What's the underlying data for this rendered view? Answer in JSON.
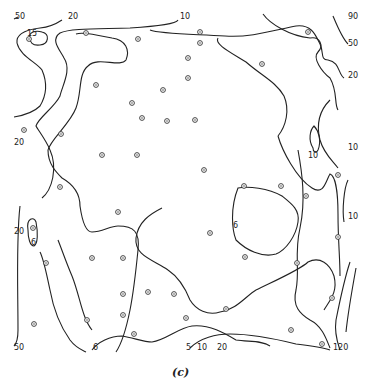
{
  "figure": {
    "caption": "(c)",
    "contour_labels": [
      {
        "text": "50",
        "x": 15,
        "y": 19
      },
      {
        "text": "20",
        "x": 68,
        "y": 19
      },
      {
        "text": "10",
        "x": 180,
        "y": 19
      },
      {
        "text": "90",
        "x": 348,
        "y": 19
      },
      {
        "text": "50",
        "x": 348,
        "y": 46
      },
      {
        "text": "20",
        "x": 348,
        "y": 78
      },
      {
        "text": "10",
        "x": 348,
        "y": 150
      },
      {
        "text": "20",
        "x": 14,
        "y": 145
      },
      {
        "text": "10",
        "x": 308,
        "y": 158
      },
      {
        "text": "10",
        "x": 348,
        "y": 219
      },
      {
        "text": "20",
        "x": 14,
        "y": 234
      },
      {
        "text": "6",
        "x": 31,
        "y": 245
      },
      {
        "text": "6",
        "x": 233,
        "y": 228
      },
      {
        "text": "50",
        "x": 14,
        "y": 350
      },
      {
        "text": "6",
        "x": 93,
        "y": 350
      },
      {
        "text": "5",
        "x": 186,
        "y": 350
      },
      {
        "text": "10",
        "x": 197,
        "y": 350
      },
      {
        "text": "20",
        "x": 217,
        "y": 350
      },
      {
        "text": "120",
        "x": 333,
        "y": 350
      },
      {
        "text": "15",
        "x": 27,
        "y": 36
      }
    ],
    "sample_points": [
      [
        29,
        39
      ],
      [
        86,
        33
      ],
      [
        138,
        39
      ],
      [
        200,
        32
      ],
      [
        200,
        43
      ],
      [
        188,
        58
      ],
      [
        262,
        64
      ],
      [
        308,
        32
      ],
      [
        96,
        85
      ],
      [
        163,
        90
      ],
      [
        188,
        78
      ],
      [
        132,
        103
      ],
      [
        142,
        118
      ],
      [
        167,
        121
      ],
      [
        195,
        120
      ],
      [
        61,
        134
      ],
      [
        102,
        155
      ],
      [
        137,
        155
      ],
      [
        24,
        130
      ],
      [
        204,
        170
      ],
      [
        244,
        186
      ],
      [
        281,
        186
      ],
      [
        306,
        196
      ],
      [
        338,
        175
      ],
      [
        60,
        187
      ],
      [
        118,
        212
      ],
      [
        210,
        233
      ],
      [
        338,
        237
      ],
      [
        33,
        228
      ],
      [
        46,
        263
      ],
      [
        92,
        258
      ],
      [
        123,
        258
      ],
      [
        245,
        257
      ],
      [
        297,
        263
      ],
      [
        148,
        292
      ],
      [
        123,
        294
      ],
      [
        174,
        294
      ],
      [
        226,
        309
      ],
      [
        332,
        298
      ],
      [
        87,
        320
      ],
      [
        123,
        315
      ],
      [
        134,
        334
      ],
      [
        186,
        318
      ],
      [
        34,
        324
      ],
      [
        291,
        330
      ],
      [
        322,
        344
      ]
    ]
  }
}
